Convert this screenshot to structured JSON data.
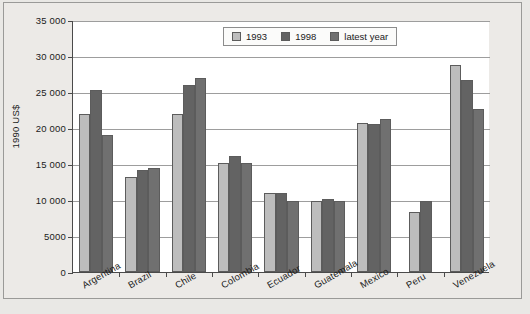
{
  "chart_data": {
    "type": "bar",
    "title": "",
    "xlabel": "",
    "ylabel": "1990 US$",
    "ylim": [
      0,
      35000
    ],
    "ytick_labels": [
      "0",
      "5000",
      "10 000",
      "15 000",
      "20 000",
      "25 000",
      "30 000",
      "35 000"
    ],
    "ytick_values": [
      0,
      5000,
      10000,
      15000,
      20000,
      25000,
      30000,
      35000
    ],
    "grid": true,
    "legend_position": "top-right",
    "categories": [
      "Argentina",
      "Brazil",
      "Chile",
      "Colombia",
      "Ecuador",
      "Guatemala",
      "Mexico",
      "Peru",
      "Venezuela"
    ],
    "series": [
      {
        "name": "1993",
        "color": "#bdbdbd",
        "values": [
          22000,
          13200,
          22000,
          15100,
          11000,
          9900,
          20700,
          8400,
          28800
        ]
      },
      {
        "name": "1998",
        "color": "#636363",
        "values": [
          25300,
          14200,
          26000,
          16100,
          11000,
          10200,
          20600,
          9800,
          26700
        ]
      },
      {
        "name": "latest year",
        "color": "#707070",
        "values": [
          19000,
          14400,
          27000,
          15100,
          9900,
          9800,
          21300,
          null,
          22700
        ]
      }
    ]
  },
  "axis": {
    "y_title": "1990 US$"
  },
  "legend": {
    "items": [
      {
        "label": "1993",
        "color": "#bdbdbd"
      },
      {
        "label": "1998",
        "color": "#636363"
      },
      {
        "label": "latest year",
        "color": "#707070"
      }
    ]
  },
  "footnote": {
    "text": ""
  }
}
